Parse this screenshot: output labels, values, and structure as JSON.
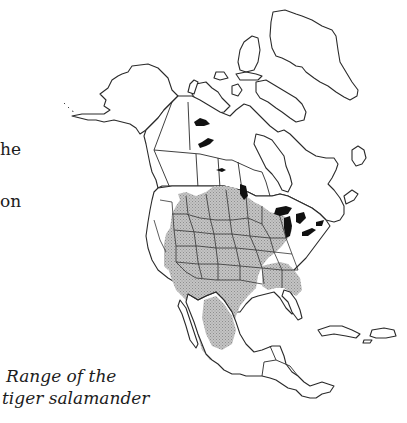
{
  "page": {
    "fragments": [
      {
        "text": "he"
      },
      {
        "text": "on"
      }
    ],
    "caption": {
      "line1": "Range of the",
      "line2": "tiger salamander"
    }
  },
  "map": {
    "subject": "Range of the tiger salamander",
    "region": "North America",
    "colors": {
      "outline": "#2a2a2a",
      "range_fill": "#b8b8b8",
      "lakes": "#111111",
      "background": "#ffffff"
    },
    "legend_semantics": {
      "shaded_area": "species range",
      "black_areas": "large lakes"
    }
  }
}
